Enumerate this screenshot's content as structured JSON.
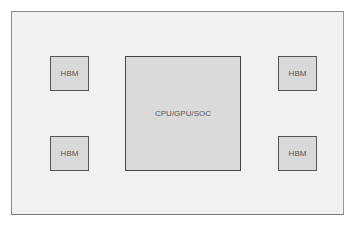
{
  "diagram": {
    "processor": {
      "label": "CPU/GPU/SOC"
    },
    "memory": [
      {
        "position": "top-left",
        "label": "HBM"
      },
      {
        "position": "top-right",
        "label": "HBM"
      },
      {
        "position": "bottom-left",
        "label": "HBM"
      },
      {
        "position": "bottom-right",
        "label": "HBM"
      }
    ]
  },
  "colors": {
    "frame_fill": "#f1f1f1",
    "box_fill": "#d9d9d9",
    "border": "#555555",
    "text": "#555555"
  }
}
